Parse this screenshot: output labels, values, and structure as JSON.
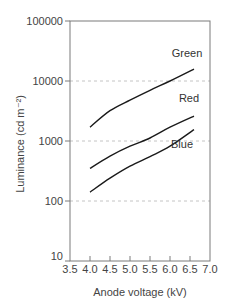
{
  "chart_data": {
    "type": "line",
    "title": "",
    "xlabel": "Anode voltage (kV)",
    "ylabel": "Luminance (cd m⁻²)",
    "xlim": [
      3.5,
      7.0
    ],
    "ylim": [
      10,
      100000
    ],
    "yscale": "log",
    "grid": "horizontal dashed at decades",
    "legend": "inline labels near line ends",
    "x_ticks": [
      "3.5",
      "4.0",
      "4.5",
      "5.0",
      "5.5",
      "6.0",
      "6.5",
      "7.0"
    ],
    "y_ticks": [
      "10",
      "100",
      "1000",
      "10000",
      "100000"
    ],
    "x": [
      4.0,
      4.5,
      5.0,
      5.5,
      6.0,
      6.6
    ],
    "series": [
      {
        "name": "Green",
        "values": [
          1700,
          3200,
          4800,
          7000,
          10000,
          15800
        ]
      },
      {
        "name": "Red",
        "values": [
          350,
          560,
          820,
          1120,
          1700,
          2600
        ]
      },
      {
        "name": "Blue",
        "values": [
          140,
          240,
          380,
          550,
          820,
          1550
        ]
      }
    ]
  }
}
